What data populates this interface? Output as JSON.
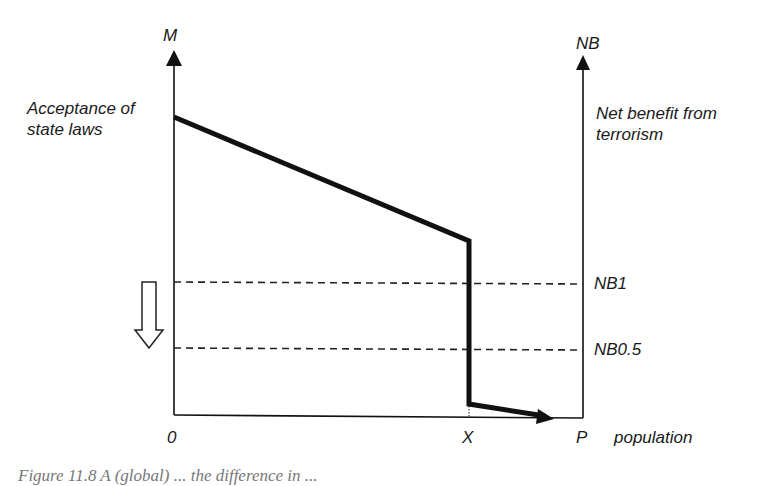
{
  "figure": {
    "left_axis_label": "M",
    "right_axis_label": "NB",
    "left_curve_label_line1": "Acceptance of",
    "left_curve_label_line2": "state laws",
    "right_curve_label_line1": "Net benefit from",
    "right_curve_label_line2": "terrorism",
    "level_labels": [
      "NB1",
      "NB0.5"
    ],
    "x_ticks": [
      "0",
      "X",
      "P"
    ],
    "x_axis_label": "population",
    "caption_fragment": "Figure 11.8 A (global) ... the difference in ..."
  },
  "colors": {
    "ink": "#111111",
    "dashed": "#222222",
    "background": "#ffffff"
  }
}
